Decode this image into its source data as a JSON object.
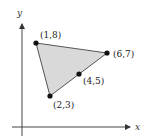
{
  "diagram": {
    "axes": {
      "x_label": "x",
      "y_label": "y"
    },
    "triangle": {
      "fill": "#d9d9d9",
      "vertices": [
        "(1,8)",
        "(6,7)",
        "(2,3)"
      ]
    },
    "points": [
      {
        "label": "(1,8)",
        "x": 1,
        "y": 8
      },
      {
        "label": "(6,7)",
        "x": 6,
        "y": 7
      },
      {
        "label": "(4,5)",
        "x": 4,
        "y": 5
      },
      {
        "label": "(2,3)",
        "x": 2,
        "y": 3
      }
    ]
  }
}
